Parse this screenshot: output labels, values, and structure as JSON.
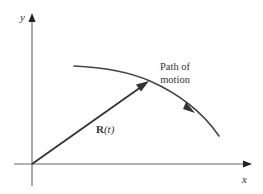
{
  "diagram": {
    "axes": {
      "x_label": "x",
      "y_label": "y"
    },
    "vector": {
      "symbol": "R",
      "argument": "(t)"
    },
    "path": {
      "label_line1": "Path of",
      "label_line2": "motion"
    },
    "colors": {
      "stroke": "#333333",
      "axis": "#555555",
      "background": "#ffffff"
    }
  }
}
